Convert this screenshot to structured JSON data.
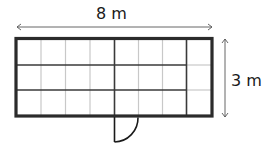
{
  "diagram": {
    "type": "floor-plan",
    "dimensions": {
      "width_label": "8 m",
      "height_label": "3 m"
    },
    "grid": {
      "columns": 8,
      "rows": 3
    },
    "colors": {
      "wall": "#2b2b2b",
      "grid_major": "#3a3a3a",
      "grid_minor": "#c8c8c8",
      "arrow": "#555555",
      "text": "#1a1a1a"
    },
    "door": {
      "position": "bottom wall, center",
      "swing": "outward"
    }
  }
}
